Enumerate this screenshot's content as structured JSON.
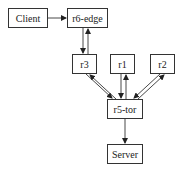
{
  "diagram": {
    "nodes": [
      {
        "id": "client",
        "label": "Client"
      },
      {
        "id": "r6-edge",
        "label": "r6-edge"
      },
      {
        "id": "r3",
        "label": "r3"
      },
      {
        "id": "r1",
        "label": "r1"
      },
      {
        "id": "r2",
        "label": "r2"
      },
      {
        "id": "r5-tor",
        "label": "r5-tor"
      },
      {
        "id": "server",
        "label": "Server"
      }
    ],
    "edges": [
      {
        "from": "client",
        "to": "r6-edge"
      },
      {
        "from": "r6-edge",
        "to": "r3"
      },
      {
        "from": "r3",
        "to": "r6-edge"
      },
      {
        "from": "r3",
        "to": "r5-tor"
      },
      {
        "from": "r5-tor",
        "to": "r3"
      },
      {
        "from": "r1",
        "to": "r5-tor"
      },
      {
        "from": "r5-tor",
        "to": "r1"
      },
      {
        "from": "r2",
        "to": "r5-tor"
      },
      {
        "from": "r5-tor",
        "to": "r2"
      },
      {
        "from": "r5-tor",
        "to": "server"
      }
    ]
  }
}
